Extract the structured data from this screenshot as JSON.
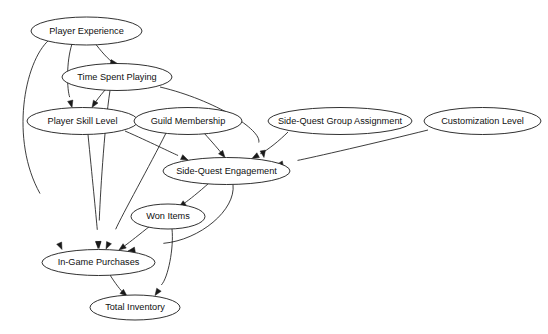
{
  "diagram": {
    "type": "directed-acyclic-graph",
    "background_color": "#ffffff",
    "node_fill_color": "#ffffff",
    "node_stroke_color": "#1a1a1a",
    "edge_color": "#1a1a1a",
    "node_count": 9,
    "edge_count": 16,
    "nodes": [
      {
        "id": "player_experience",
        "label": "Player Experience",
        "cx": 86.5,
        "cy": 31,
        "rx": 55.5,
        "ry": 14
      },
      {
        "id": "time_spent_playing",
        "label": "Time Spent Playing",
        "cx": 117,
        "cy": 77,
        "rx": 55,
        "ry": 13.5
      },
      {
        "id": "player_skill_level",
        "label": "Player Skill Level",
        "cx": 82.5,
        "cy": 121,
        "rx": 55.5,
        "ry": 13.5
      },
      {
        "id": "guild_membership",
        "label": "Guild Membership",
        "cx": 188,
        "cy": 121,
        "rx": 54,
        "ry": 13.5
      },
      {
        "id": "side_quest_group_assignment",
        "label": "Side-Quest Group Assignment",
        "cx": 340,
        "cy": 121,
        "rx": 72,
        "ry": 13.5
      },
      {
        "id": "customization_level",
        "label": "Customization Level",
        "cx": 482.5,
        "cy": 121,
        "rx": 58.5,
        "ry": 13.5
      },
      {
        "id": "side_quest_engagement",
        "label": "Side-Quest Engagement",
        "cx": 226.5,
        "cy": 171,
        "rx": 63.5,
        "ry": 13.5
      },
      {
        "id": "won_items",
        "label": "Won Items",
        "cx": 168,
        "cy": 216.5,
        "rx": 37,
        "ry": 12.5
      },
      {
        "id": "in_game_purchases",
        "label": "In-Game Purchases",
        "cx": 98.5,
        "cy": 262.5,
        "rx": 56.5,
        "ry": 13
      },
      {
        "id": "total_inventory",
        "label": "Total Inventory",
        "cx": 135,
        "cy": 307.5,
        "rx": 45,
        "ry": 12.5
      }
    ],
    "edges": [
      {
        "from": "Player Experience",
        "to": "Time Spent Playing"
      },
      {
        "from": "Player Experience",
        "to": "Player Skill Level"
      },
      {
        "from": "Player Experience",
        "to": "In-Game Purchases"
      },
      {
        "from": "Time Spent Playing",
        "to": "Player Skill Level"
      },
      {
        "from": "Time Spent Playing",
        "to": "Side-Quest Engagement"
      },
      {
        "from": "Time Spent Playing",
        "to": "In-Game Purchases"
      },
      {
        "from": "Player Skill Level",
        "to": "Side-Quest Engagement"
      },
      {
        "from": "Player Skill Level",
        "to": "In-Game Purchases"
      },
      {
        "from": "Guild Membership",
        "to": "Side-Quest Engagement"
      },
      {
        "from": "Guild Membership",
        "to": "In-Game Purchases"
      },
      {
        "from": "Side-Quest Group Assignment",
        "to": "Side-Quest Engagement"
      },
      {
        "from": "Customization Level",
        "to": "Side-Quest Engagement"
      },
      {
        "from": "Side-Quest Engagement",
        "to": "Won Items"
      },
      {
        "from": "Side-Quest Engagement",
        "to": "In-Game Purchases"
      },
      {
        "from": "Won Items",
        "to": "In-Game Purchases"
      },
      {
        "from": "Won Items",
        "to": "Total Inventory"
      },
      {
        "from": "In-Game Purchases",
        "to": "Total Inventory"
      }
    ]
  }
}
